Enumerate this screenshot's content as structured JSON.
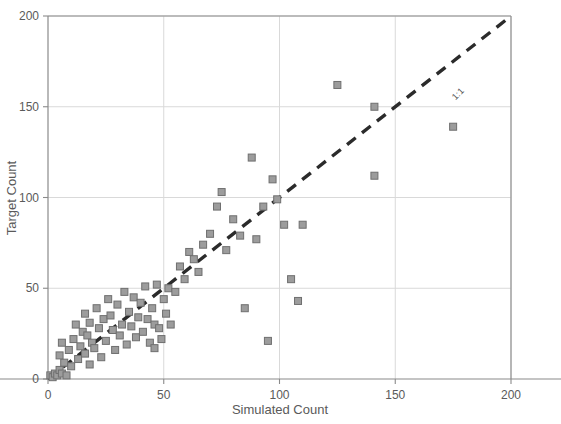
{
  "chart_data": {
    "type": "scatter",
    "title": "",
    "xlabel": "Simulated Count",
    "ylabel": "Target Count",
    "xlim": [
      0,
      200
    ],
    "ylim": [
      0,
      200
    ],
    "xticks": [
      0,
      50,
      100,
      150,
      200
    ],
    "yticks": [
      0,
      50,
      100,
      150,
      200
    ],
    "xtick_labels": [
      "0",
      "50",
      "100",
      "150",
      "200"
    ],
    "ytick_labels": [
      "0",
      "50",
      "100",
      "150",
      "200"
    ],
    "grid": true,
    "legend": "none",
    "annotations": [
      {
        "text": "1:1",
        "x": 176,
        "y": 176,
        "rotation": -45
      }
    ],
    "reference_line": {
      "label": "1:1",
      "slope": 1,
      "intercept": 0,
      "style": "dashed",
      "color": "#2b2b2b",
      "from": [
        0,
        0
      ],
      "to": [
        200,
        200
      ]
    },
    "marker_style": {
      "shape": "square",
      "fill": "#9c9c9c",
      "edge": "#6f6f6f",
      "size": 7
    },
    "series": [
      {
        "name": "Sites",
        "points": [
          [
            1,
            2
          ],
          [
            2,
            1
          ],
          [
            3,
            3
          ],
          [
            4,
            2
          ],
          [
            5,
            5
          ],
          [
            6,
            3
          ],
          [
            7,
            9
          ],
          [
            8,
            2
          ],
          [
            5,
            13
          ],
          [
            6,
            20
          ],
          [
            9,
            16
          ],
          [
            10,
            7
          ],
          [
            11,
            22
          ],
          [
            12,
            30
          ],
          [
            13,
            11
          ],
          [
            14,
            18
          ],
          [
            15,
            26
          ],
          [
            16,
            14
          ],
          [
            16,
            36
          ],
          [
            17,
            24
          ],
          [
            18,
            8
          ],
          [
            18,
            31
          ],
          [
            19,
            20
          ],
          [
            20,
            17
          ],
          [
            21,
            39
          ],
          [
            22,
            28
          ],
          [
            23,
            12
          ],
          [
            24,
            33
          ],
          [
            25,
            21
          ],
          [
            26,
            44
          ],
          [
            27,
            35
          ],
          [
            28,
            27
          ],
          [
            29,
            16
          ],
          [
            30,
            41
          ],
          [
            31,
            24
          ],
          [
            32,
            30
          ],
          [
            33,
            48
          ],
          [
            34,
            19
          ],
          [
            35,
            37
          ],
          [
            36,
            29
          ],
          [
            37,
            45
          ],
          [
            38,
            23
          ],
          [
            39,
            34
          ],
          [
            40,
            42
          ],
          [
            41,
            26
          ],
          [
            42,
            51
          ],
          [
            43,
            33
          ],
          [
            44,
            20
          ],
          [
            45,
            39
          ],
          [
            46,
            30
          ],
          [
            46,
            17
          ],
          [
            47,
            52
          ],
          [
            48,
            28
          ],
          [
            49,
            22
          ],
          [
            50,
            44
          ],
          [
            51,
            36
          ],
          [
            52,
            50
          ],
          [
            53,
            30
          ],
          [
            55,
            48
          ],
          [
            57,
            62
          ],
          [
            59,
            55
          ],
          [
            61,
            70
          ],
          [
            63,
            66
          ],
          [
            65,
            59
          ],
          [
            67,
            74
          ],
          [
            70,
            80
          ],
          [
            73,
            95
          ],
          [
            75,
            103
          ],
          [
            77,
            71
          ],
          [
            80,
            88
          ],
          [
            83,
            79
          ],
          [
            85,
            39
          ],
          [
            88,
            122
          ],
          [
            90,
            77
          ],
          [
            93,
            95
          ],
          [
            95,
            21
          ],
          [
            97,
            110
          ],
          [
            99,
            99
          ],
          [
            102,
            85
          ],
          [
            105,
            55
          ],
          [
            108,
            43
          ],
          [
            110,
            85
          ],
          [
            125,
            162
          ],
          [
            141,
            112
          ],
          [
            141,
            150
          ],
          [
            175,
            139
          ]
        ]
      }
    ]
  },
  "axes": {
    "x_title": "Simulated Count",
    "y_title": "Target Count"
  }
}
